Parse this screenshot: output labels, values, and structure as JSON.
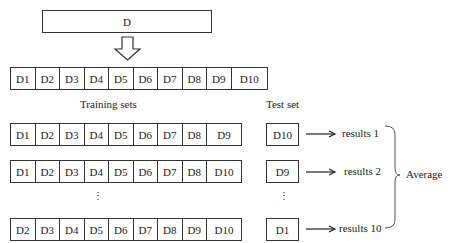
{
  "dataset": {
    "label": "D"
  },
  "folds_row": [
    "D1",
    "D2",
    "D3",
    "D4",
    "D5",
    "D6",
    "D7",
    "D8",
    "D9",
    "D10"
  ],
  "headers": {
    "training": "Training sets",
    "test": "Test set"
  },
  "iterations": [
    {
      "train": [
        "D1",
        "D2",
        "D3",
        "D4",
        "D5",
        "D6",
        "D7",
        "D8",
        "D9"
      ],
      "test": "D10",
      "result": "results 1"
    },
    {
      "train": [
        "D1",
        "D2",
        "D3",
        "D4",
        "D5",
        "D6",
        "D7",
        "D8",
        "D10"
      ],
      "test": "D9",
      "result": "results 2"
    },
    {
      "train": [
        "D2",
        "D3",
        "D4",
        "D5",
        "D6",
        "D7",
        "D8",
        "D9",
        "D10"
      ],
      "test": "D1",
      "result": "results 10"
    }
  ],
  "ellipsis": "⋮",
  "aggregate": {
    "label": "Average"
  }
}
